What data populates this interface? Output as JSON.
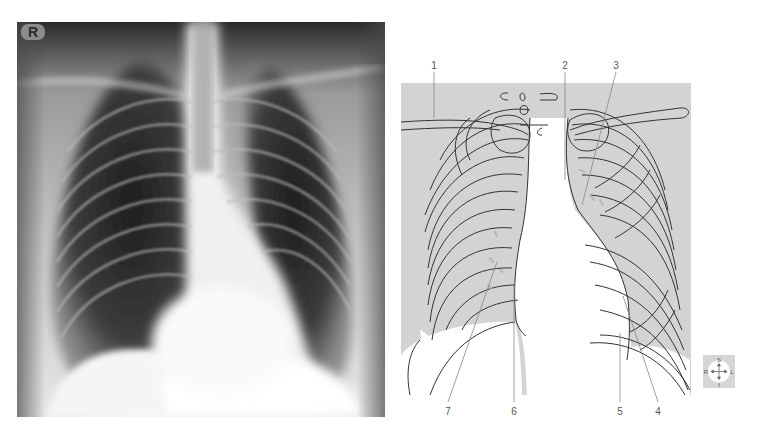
{
  "xray": {
    "marker": "R",
    "colors": {
      "dark": "#1a1a1a",
      "mid": "#6e6e6e",
      "bright": "#ffffff"
    }
  },
  "diagram": {
    "panel_color": "#d3d3d3",
    "line_color": "#333333",
    "leader_color": "#888888",
    "labels": [
      {
        "id": "1",
        "text": "1",
        "x": 434,
        "y": 60,
        "tip": [
          434,
          118
        ]
      },
      {
        "id": "2",
        "text": "2",
        "x": 565,
        "y": 60,
        "tip": [
          565,
          180
        ]
      },
      {
        "id": "3",
        "text": "3",
        "x": 616,
        "y": 60,
        "tip": [
          582,
          205
        ]
      },
      {
        "id": "4",
        "text": "4",
        "x": 658,
        "y": 406,
        "tip": [
          623,
          296
        ]
      },
      {
        "id": "5",
        "text": "5",
        "x": 620,
        "y": 406,
        "tip": [
          620,
          333
        ]
      },
      {
        "id": "6",
        "text": "6",
        "x": 514,
        "y": 406,
        "tip": [
          514,
          283
        ]
      },
      {
        "id": "7",
        "text": "7",
        "x": 448,
        "y": 406,
        "tip": [
          497,
          262
        ]
      }
    ]
  },
  "orientation": {
    "top": "S",
    "left": "R",
    "right": "L",
    "bottom": "I",
    "bg": "#d6d6d6"
  }
}
